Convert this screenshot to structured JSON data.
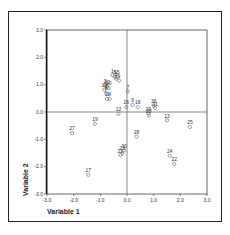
{
  "chart_data": {
    "type": "scatter",
    "title": "",
    "xlabel": "Variable 1",
    "ylabel": "Variable 2",
    "xlim": [
      -3.0,
      3.0
    ],
    "ylim": [
      -3.0,
      3.0
    ],
    "xticks": [
      "-3.0",
      "-2.0",
      "-1.0",
      "0.0",
      "1.0",
      "2.0",
      "3.0"
    ],
    "yticks": [
      "3.0",
      "2.0",
      "1.0",
      "0.0",
      "-1.0",
      "-2.0",
      "-3.0"
    ],
    "grid": false,
    "reference_lines": {
      "x": 0.0,
      "y": 0.0
    },
    "marker": "open-circle",
    "points": [
      {
        "label": "1",
        "x": -0.55,
        "y": 1.35
      },
      {
        "label": "5",
        "x": -0.45,
        "y": 1.3
      },
      {
        "label": "15",
        "x": -0.38,
        "y": 1.28
      },
      {
        "label": "3",
        "x": -0.42,
        "y": 1.22
      },
      {
        "label": "9",
        "x": -0.3,
        "y": 1.15
      },
      {
        "label": "7",
        "x": 0.03,
        "y": 0.75
      },
      {
        "label": "2",
        "x": -0.82,
        "y": 0.98
      },
      {
        "label": "32",
        "x": -0.75,
        "y": 0.92
      },
      {
        "label": "10",
        "x": -0.68,
        "y": 0.88
      },
      {
        "label": "14",
        "x": -0.85,
        "y": 0.82
      },
      {
        "label": "8",
        "x": -0.78,
        "y": 0.7
      },
      {
        "label": "4",
        "x": -0.65,
        "y": 0.48
      },
      {
        "label": "11",
        "x": -0.75,
        "y": 0.48
      },
      {
        "label": "26",
        "x": -0.03,
        "y": 0.18
      },
      {
        "label": "6",
        "x": 0.21,
        "y": 0.26
      },
      {
        "label": "18",
        "x": 0.4,
        "y": 0.18
      },
      {
        "label": "36",
        "x": 1.0,
        "y": 0.22
      },
      {
        "label": "31",
        "x": 1.05,
        "y": 0.14
      },
      {
        "label": "20",
        "x": 0.82,
        "y": -0.13
      },
      {
        "label": "29",
        "x": 0.8,
        "y": -0.05
      },
      {
        "label": "12",
        "x": -0.32,
        "y": -0.07
      },
      {
        "label": "13",
        "x": 1.5,
        "y": -0.3
      },
      {
        "label": "19",
        "x": -1.2,
        "y": -0.43
      },
      {
        "label": "25",
        "x": 2.36,
        "y": -0.55
      },
      {
        "label": "27",
        "x": -2.06,
        "y": -0.77
      },
      {
        "label": "28",
        "x": 0.36,
        "y": -0.9
      },
      {
        "label": "30",
        "x": -0.11,
        "y": -1.4
      },
      {
        "label": "23",
        "x": -0.18,
        "y": -1.5
      },
      {
        "label": "21",
        "x": -0.25,
        "y": -1.58
      },
      {
        "label": "24",
        "x": 1.6,
        "y": -1.6
      },
      {
        "label": "22",
        "x": 1.77,
        "y": -1.9
      },
      {
        "label": "17",
        "x": -1.45,
        "y": -2.3
      }
    ]
  },
  "axes": {
    "x_label": "Variable 1",
    "y_label": "Variable 2"
  }
}
